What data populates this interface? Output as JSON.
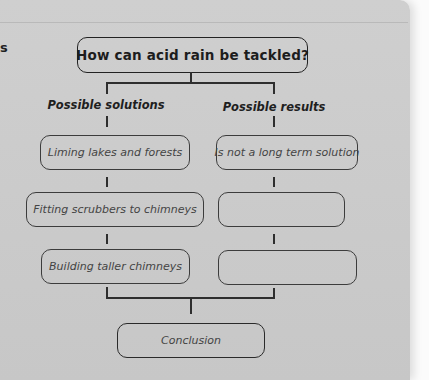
{
  "diagram": {
    "type": "flowchart",
    "question": "How can acid rain be tackled?",
    "columns": [
      {
        "heading": "Possible solutions",
        "boxes": [
          "Liming lakes and forests",
          "Fitting scrubbers to chimneys",
          "Building taller chimneys"
        ]
      },
      {
        "heading": "Possible results",
        "boxes": [
          "Is not a long term solution",
          "",
          ""
        ]
      }
    ],
    "conclusion": "Conclusion"
  },
  "page": {
    "margin_mark": "s",
    "colors": {
      "paper": "#cbcbcb",
      "ink": "#222222",
      "background": "#fbfbfb"
    }
  }
}
